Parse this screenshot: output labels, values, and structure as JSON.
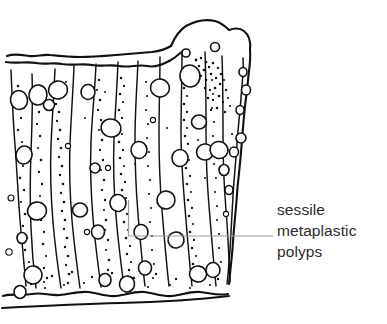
{
  "figure": {
    "kind": "line-drawing",
    "background_color": "#ffffff",
    "ink_color": "#111111",
    "stipple_color": "#1a1a1a",
    "leader_color": "#999999",
    "text_color": "#2b2b2b"
  },
  "annotation": {
    "name": "sessile-metaplastic-polyps-label",
    "lines": [
      "sessile",
      "metaplastic",
      "polyps"
    ],
    "line1": "sessile",
    "line2": "metaplastic",
    "line3": "polyps",
    "leader": {
      "horizontal_start_x": 128,
      "horizontal_end_x": 273,
      "horizontal_y": 236,
      "vertical_x": 128,
      "vertical_top_y": 200,
      "vertical_bottom_y": 236
    }
  }
}
